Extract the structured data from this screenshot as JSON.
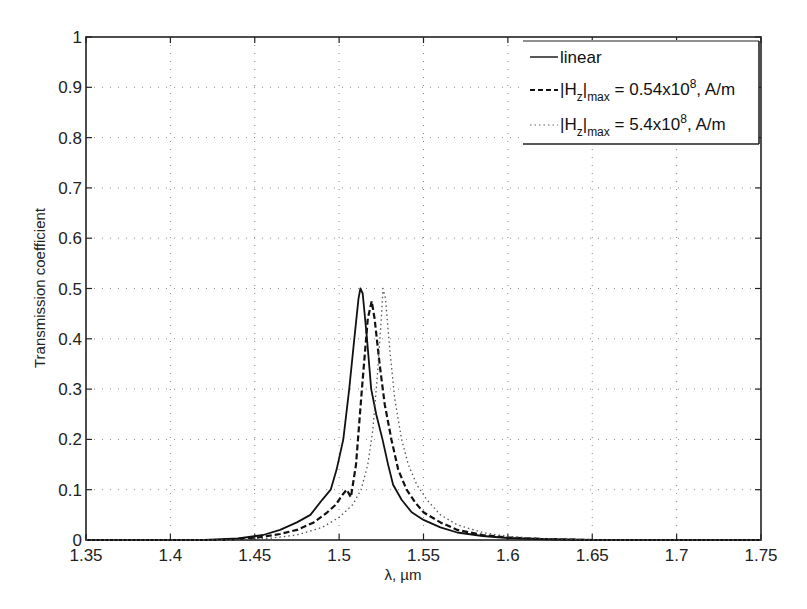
{
  "chart_data": {
    "type": "line",
    "title": "",
    "xlabel": "λ, µm",
    "ylabel": "Transmission coefficient",
    "xlim": [
      1.35,
      1.75
    ],
    "ylim": [
      0,
      1
    ],
    "grid": true,
    "legend_position": "upper right",
    "xticks": [
      "1.35",
      "1.4",
      "1.45",
      "1.5",
      "1.55",
      "1.6",
      "1.65",
      "1.7",
      "1.75"
    ],
    "yticks": [
      "0",
      "0.1",
      "0.2",
      "0.3",
      "0.4",
      "0.5",
      "0.6",
      "0.7",
      "0.8",
      "0.9",
      "1"
    ],
    "series": [
      {
        "name": "linear",
        "style": "solid",
        "x": [
          1.35,
          1.42,
          1.44,
          1.455,
          1.465,
          1.475,
          1.483,
          1.49,
          1.495,
          1.4985,
          1.5025,
          1.506,
          1.509,
          1.5115,
          1.5126,
          1.514,
          1.5165,
          1.519,
          1.522,
          1.5257,
          1.529,
          1.532,
          1.537,
          1.543,
          1.55,
          1.56,
          1.57,
          1.585,
          1.6,
          1.62,
          1.65,
          1.75
        ],
        "y": [
          0,
          0,
          0.003,
          0.01,
          0.02,
          0.035,
          0.05,
          0.08,
          0.1,
          0.14,
          0.2,
          0.3,
          0.4,
          0.48,
          0.5,
          0.49,
          0.4,
          0.3,
          0.25,
          0.2,
          0.15,
          0.11,
          0.08,
          0.055,
          0.04,
          0.025,
          0.015,
          0.008,
          0.004,
          0.002,
          0,
          0
        ]
      },
      {
        "name": "|Hz|max = 0.54x10^8, A/m",
        "style": "dashed",
        "x": [
          1.35,
          1.43,
          1.45,
          1.465,
          1.475,
          1.485,
          1.493,
          1.498,
          1.502,
          1.5045,
          1.507,
          1.51,
          1.5135,
          1.517,
          1.519,
          1.5193,
          1.521,
          1.524,
          1.527,
          1.531,
          1.535,
          1.54,
          1.545,
          1.55,
          1.56,
          1.57,
          1.585,
          1.6,
          1.62,
          1.65,
          1.75
        ],
        "y": [
          0,
          0,
          0.004,
          0.012,
          0.02,
          0.035,
          0.055,
          0.07,
          0.09,
          0.1,
          0.085,
          0.15,
          0.3,
          0.44,
          0.47,
          0.475,
          0.44,
          0.35,
          0.27,
          0.2,
          0.14,
          0.1,
          0.075,
          0.055,
          0.035,
          0.02,
          0.01,
          0.005,
          0.002,
          0,
          0
        ]
      },
      {
        "name": "|Hz|max = 5.4x10^8, A/m",
        "style": "dotted",
        "x": [
          1.35,
          1.44,
          1.46,
          1.475,
          1.49,
          1.5,
          1.508,
          1.513,
          1.517,
          1.52,
          1.5225,
          1.525,
          1.526,
          1.5275,
          1.53,
          1.533,
          1.537,
          1.541,
          1.546,
          1.552,
          1.56,
          1.57,
          1.585,
          1.6,
          1.62,
          1.65,
          1.75
        ],
        "y": [
          0,
          0,
          0.004,
          0.01,
          0.025,
          0.045,
          0.07,
          0.1,
          0.15,
          0.22,
          0.32,
          0.44,
          0.5,
          0.48,
          0.38,
          0.28,
          0.2,
          0.15,
          0.11,
          0.08,
          0.05,
          0.03,
          0.015,
          0.007,
          0.003,
          0,
          0
        ]
      }
    ]
  },
  "legend": {
    "items": [
      {
        "label": "linear",
        "style": "solid"
      },
      {
        "prefix": "|H",
        "sub": "z",
        "mid": "|",
        "sub2": "max",
        "suffix": " = 0.54x10",
        "sup": "8",
        "tail": ", A/m",
        "style": "dashed"
      },
      {
        "prefix": "|H",
        "sub": "z",
        "mid": "|",
        "sub2": "max",
        "suffix": " = 5.4x10",
        "sup": "8",
        "tail": ", A/m",
        "style": "dotted"
      }
    ]
  },
  "colors": {
    "background": "#ffffff",
    "axis": "#222222",
    "grid": "#8a8a8a",
    "line": "#111111"
  }
}
